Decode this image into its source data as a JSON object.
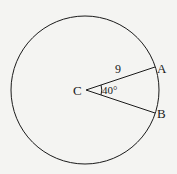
{
  "diagram": {
    "center_label": "C",
    "point_a_label": "A",
    "point_b_label": "B",
    "radius_label": "9",
    "angle_label": "40°",
    "colors": {
      "stroke": "#1a1a1a",
      "background": "#f4f4f2"
    }
  }
}
